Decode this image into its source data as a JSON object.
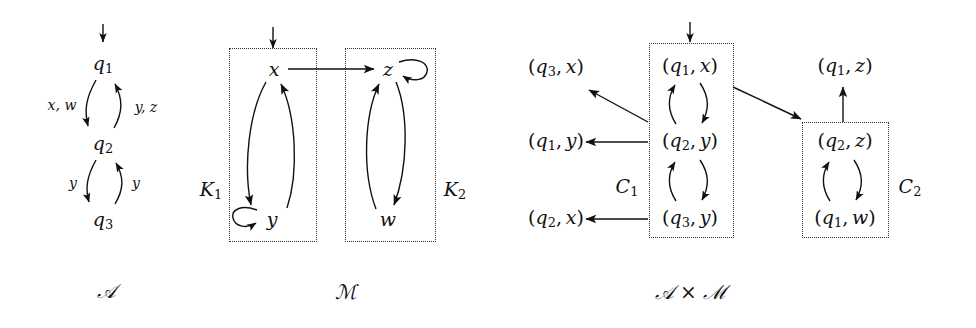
{
  "figure": {
    "caption_left": "𝒜",
    "caption_middle": "ℳ",
    "caption_right": "𝒜 × ℳ"
  },
  "automaton_A": {
    "name": "A",
    "states": [
      {
        "id": "q1",
        "label_base": "q",
        "label_sub": "1"
      },
      {
        "id": "q2",
        "label_base": "q",
        "label_sub": "2"
      },
      {
        "id": "q3",
        "label_base": "q",
        "label_sub": "3"
      }
    ],
    "initial_state": "q1",
    "transitions": [
      {
        "from": "q1",
        "to": "q2",
        "label": "x, w"
      },
      {
        "from": "q2",
        "to": "q1",
        "label": "y, z"
      },
      {
        "from": "q2",
        "to": "q3",
        "label": "y"
      },
      {
        "from": "q3",
        "to": "q2",
        "label": "y"
      }
    ]
  },
  "model_M": {
    "name": "M",
    "states": [
      {
        "id": "x",
        "label": "x"
      },
      {
        "id": "y",
        "label": "y"
      },
      {
        "id": "z",
        "label": "z"
      },
      {
        "id": "w",
        "label": "w"
      }
    ],
    "initial_state": "x",
    "components": [
      {
        "id": "K1",
        "label_base": "K",
        "label_sub": "1",
        "members": [
          "x",
          "y"
        ]
      },
      {
        "id": "K2",
        "label_base": "K",
        "label_sub": "2",
        "members": [
          "z",
          "w"
        ]
      }
    ],
    "transitions": [
      {
        "from": "x",
        "to": "y"
      },
      {
        "from": "y",
        "to": "x"
      },
      {
        "from": "y",
        "to": "y",
        "self_loop": true
      },
      {
        "from": "x",
        "to": "z"
      },
      {
        "from": "z",
        "to": "z",
        "self_loop": true
      },
      {
        "from": "z",
        "to": "w"
      },
      {
        "from": "w",
        "to": "z"
      }
    ]
  },
  "product_AxM": {
    "name": "A x M",
    "initial_state": "(q1,x)",
    "states": [
      {
        "id": "q3x",
        "left_base": "q",
        "left_sub": "3",
        "right": "x",
        "in_component": null
      },
      {
        "id": "q1y",
        "left_base": "q",
        "left_sub": "1",
        "right": "y",
        "in_component": null
      },
      {
        "id": "q2x",
        "left_base": "q",
        "left_sub": "2",
        "right": "x",
        "in_component": null
      },
      {
        "id": "q1x",
        "left_base": "q",
        "left_sub": "1",
        "right": "x",
        "in_component": "C1"
      },
      {
        "id": "q2y",
        "left_base": "q",
        "left_sub": "2",
        "right": "y",
        "in_component": "C1"
      },
      {
        "id": "q3y",
        "left_base": "q",
        "left_sub": "3",
        "right": "y",
        "in_component": "C1"
      },
      {
        "id": "q1z",
        "left_base": "q",
        "left_sub": "1",
        "right": "z",
        "in_component": null
      },
      {
        "id": "q2z",
        "left_base": "q",
        "left_sub": "2",
        "right": "z",
        "in_component": "C2"
      },
      {
        "id": "q1w",
        "left_base": "q",
        "left_sub": "1",
        "right": "w",
        "in_component": "C2"
      }
    ],
    "components": [
      {
        "id": "C1",
        "label_base": "C",
        "label_sub": "1",
        "members": [
          "q1x",
          "q2y",
          "q3y"
        ]
      },
      {
        "id": "C2",
        "label_base": "C",
        "label_sub": "2",
        "members": [
          "q2z",
          "q1w"
        ]
      }
    ],
    "transitions": [
      {
        "from": "q1x",
        "to": "q2y"
      },
      {
        "from": "q2y",
        "to": "q1x"
      },
      {
        "from": "q2y",
        "to": "q3y"
      },
      {
        "from": "q3y",
        "to": "q2y"
      },
      {
        "from": "q2y",
        "to": "q3x"
      },
      {
        "from": "q2y",
        "to": "q1y"
      },
      {
        "from": "q3y",
        "to": "q2x"
      },
      {
        "from": "q1x",
        "to": "q2z"
      },
      {
        "from": "q2z",
        "to": "q1z"
      },
      {
        "from": "q2z",
        "to": "q1w"
      },
      {
        "from": "q1w",
        "to": "q2z"
      }
    ]
  },
  "colors": {
    "ink": "#111111",
    "box_border": "#333333",
    "background": "#ffffff"
  }
}
